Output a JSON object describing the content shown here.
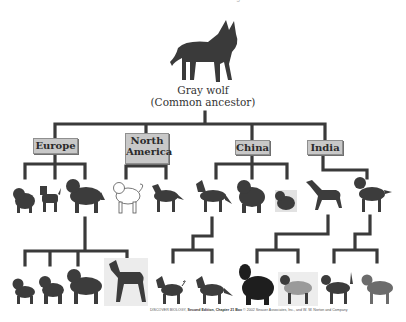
{
  "header": {
    "title": "Ancestors of the Dog"
  },
  "root": {
    "name": "Gray wolf",
    "subtitle": "(Common ancestor)",
    "icon": "wolf-icon"
  },
  "regions": [
    {
      "label": "Europe",
      "line2": ""
    },
    {
      "label": "North",
      "line2": "America"
    },
    {
      "label": "China",
      "line2": ""
    },
    {
      "label": "India",
      "line2": ""
    }
  ],
  "dogs_row1": [
    {
      "region": "Europe",
      "icon": "chow-like-dog-icon"
    },
    {
      "region": "Europe",
      "icon": "terrier-dog-icon"
    },
    {
      "region": "Europe",
      "icon": "mastiff-dog-icon"
    },
    {
      "region": "North America",
      "icon": "spitz-dog-icon"
    },
    {
      "region": "North America",
      "icon": "husky-dog-icon"
    },
    {
      "region": "China",
      "icon": "dingo-dog-icon"
    },
    {
      "region": "China",
      "icon": "chow-chow-dog-icon"
    },
    {
      "region": "China",
      "icon": "pekingese-dog-icon"
    },
    {
      "region": "India",
      "icon": "greyhound-dog-icon"
    },
    {
      "region": "India",
      "icon": "hound-dog-icon"
    }
  ],
  "dogs_row2": [
    {
      "icon": "pug-dog-icon"
    },
    {
      "icon": "bulldog-dog-icon"
    },
    {
      "icon": "saint-bernard-dog-icon"
    },
    {
      "icon": "great-dane-dog-icon"
    },
    {
      "icon": "shiba-dog-icon"
    },
    {
      "icon": "wild-dog-icon"
    },
    {
      "icon": "afghan-dog-icon"
    },
    {
      "icon": "spaniel-dog-icon"
    },
    {
      "icon": "beagle-dog-icon"
    },
    {
      "icon": "setter-dog-icon"
    }
  ],
  "caption": {
    "book": "DISCOVER BIOLOGY,",
    "edition": " Second Edition, Chapter 21 Box",
    "copyright": "  © 2002 Sinauer Associates, Inc., and W. W. Norton and Company"
  },
  "colors": {
    "line": "#3a3a3a",
    "box": "#c8c8c8",
    "dog": "#3c3c3c"
  }
}
